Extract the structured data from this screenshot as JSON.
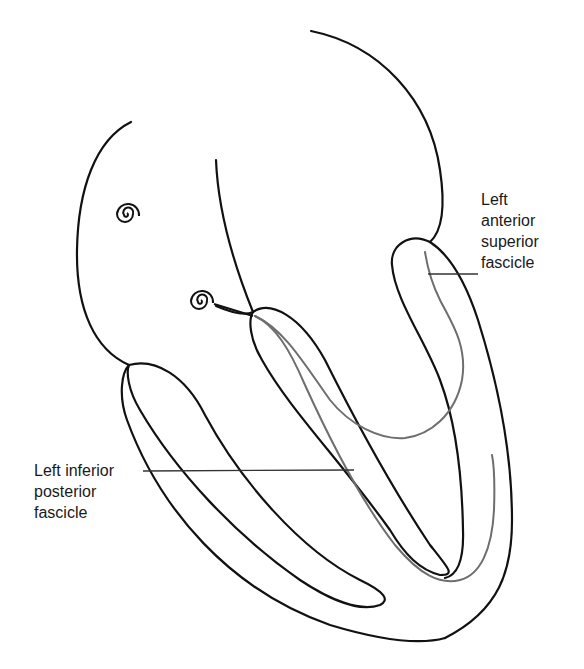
{
  "figure": {
    "type": "anatomical diagram",
    "colors": {
      "outline": "#111111",
      "fascicle": "#6e6e6e",
      "leader_line": "#333333",
      "background": "#ffffff"
    },
    "labels": [
      {
        "id": "lasf",
        "text": "Left\nanterior\nsuperior\nfascicle"
      },
      {
        "id": "lipf",
        "text": "Left inferior\nposterior\nfascicle"
      }
    ],
    "nodes": [
      {
        "name": "sinoatrial-node",
        "shape": "spiral"
      },
      {
        "name": "atrioventricular-node",
        "shape": "spiral"
      }
    ]
  }
}
